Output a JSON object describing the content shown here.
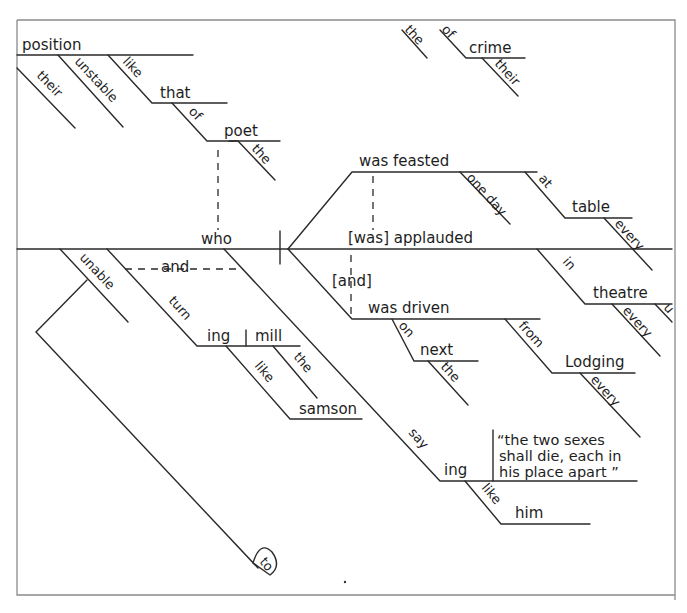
{
  "diagram": {
    "type": "Reed-Kellogg sentence diagram",
    "style": "hand-drawn",
    "colors": {
      "ink": "#2a2a2a",
      "frame": "#8a8a8a",
      "background": "#ffffff"
    },
    "words": {
      "position": "position",
      "their_1": "their",
      "unstable": "unstable",
      "like_1": "like",
      "that": "that",
      "of": "of",
      "poet": "poet",
      "the_1": "the",
      "the_top": "the",
      "of_top": "of",
      "crime": "crime",
      "their_2": "their",
      "who": "who",
      "was_feasted": "was feasted",
      "one_day": "one day",
      "at": "at",
      "table": "table",
      "every_1": "every",
      "was_applauded": "[was] applauded",
      "in": "in",
      "theatre": "theatre",
      "every_2": "every",
      "u_fragment": "u",
      "and_bracket": "[and]",
      "was_driven": "was driven",
      "on": "on",
      "next": "next",
      "the_2": "the",
      "from": "from",
      "lodging": "Lodging",
      "every_3": "every",
      "unable": "unable",
      "and_dash": "and",
      "turn": "turn",
      "ing_1": "ing",
      "mill": "mill",
      "the_3": "the",
      "like_2": "like",
      "samson": "samson",
      "say": "say",
      "ing_2": "ing",
      "like_3": "like",
      "him": "him",
      "to": "to"
    },
    "quotation": {
      "line1": "“the two sexes",
      "line2": "shall die, each in",
      "line3": "his place apart ”"
    }
  }
}
